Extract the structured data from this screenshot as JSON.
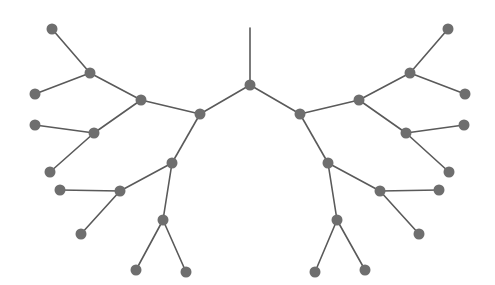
{
  "diagram": {
    "type": "binary-tree",
    "colors": {
      "edge": "#5a5a5a",
      "node": "#6e6e6e",
      "background": "#ffffff"
    },
    "node_radius": 5.5,
    "stem": {
      "x1": 250,
      "y1": 28,
      "x2": 250,
      "y2": 85
    },
    "nodes": [
      {
        "id": "root",
        "x": 250,
        "y": 85
      },
      {
        "id": "L1",
        "x": 200,
        "y": 114
      },
      {
        "id": "L2a",
        "x": 141,
        "y": 100
      },
      {
        "id": "L3a",
        "x": 90,
        "y": 73
      },
      {
        "id": "L4a1",
        "x": 52,
        "y": 29
      },
      {
        "id": "L4a2",
        "x": 35,
        "y": 94
      },
      {
        "id": "L3b",
        "x": 94,
        "y": 133
      },
      {
        "id": "L4b1",
        "x": 35,
        "y": 125
      },
      {
        "id": "L4b2",
        "x": 50,
        "y": 172
      },
      {
        "id": "L2b",
        "x": 172,
        "y": 163
      },
      {
        "id": "L3c",
        "x": 120,
        "y": 191
      },
      {
        "id": "L4c1",
        "x": 60,
        "y": 190
      },
      {
        "id": "L4c2",
        "x": 81,
        "y": 234
      },
      {
        "id": "L3d",
        "x": 163,
        "y": 220
      },
      {
        "id": "L4d1",
        "x": 136,
        "y": 270
      },
      {
        "id": "L4d2",
        "x": 186,
        "y": 272
      },
      {
        "id": "R1",
        "x": 300,
        "y": 114
      },
      {
        "id": "R2a",
        "x": 359,
        "y": 100
      },
      {
        "id": "R3a",
        "x": 410,
        "y": 73
      },
      {
        "id": "R4a1",
        "x": 448,
        "y": 29
      },
      {
        "id": "R4a2",
        "x": 465,
        "y": 94
      },
      {
        "id": "R3b",
        "x": 406,
        "y": 133
      },
      {
        "id": "R4b1",
        "x": 464,
        "y": 125
      },
      {
        "id": "R4b2",
        "x": 449,
        "y": 172
      },
      {
        "id": "R2b",
        "x": 328,
        "y": 163
      },
      {
        "id": "R3c",
        "x": 380,
        "y": 191
      },
      {
        "id": "R4c1",
        "x": 439,
        "y": 190
      },
      {
        "id": "R4c2",
        "x": 419,
        "y": 234
      },
      {
        "id": "R3d",
        "x": 337,
        "y": 220
      },
      {
        "id": "R4d1",
        "x": 315,
        "y": 272
      },
      {
        "id": "R4d2",
        "x": 365,
        "y": 270
      }
    ],
    "edges": [
      [
        "root",
        "L1"
      ],
      [
        "root",
        "R1"
      ],
      [
        "L1",
        "L2a"
      ],
      [
        "L1",
        "L2b"
      ],
      [
        "L2a",
        "L3a"
      ],
      [
        "L2a",
        "L3b"
      ],
      [
        "L3a",
        "L4a1"
      ],
      [
        "L3a",
        "L4a2"
      ],
      [
        "L3b",
        "L4b1"
      ],
      [
        "L3b",
        "L4b2"
      ],
      [
        "L2b",
        "L3c"
      ],
      [
        "L2b",
        "L3d"
      ],
      [
        "L3c",
        "L4c1"
      ],
      [
        "L3c",
        "L4c2"
      ],
      [
        "L3d",
        "L4d1"
      ],
      [
        "L3d",
        "L4d2"
      ],
      [
        "R1",
        "R2a"
      ],
      [
        "R1",
        "R2b"
      ],
      [
        "R2a",
        "R3a"
      ],
      [
        "R2a",
        "R3b"
      ],
      [
        "R3a",
        "R4a1"
      ],
      [
        "R3a",
        "R4a2"
      ],
      [
        "R3b",
        "R4b1"
      ],
      [
        "R3b",
        "R4b2"
      ],
      [
        "R2b",
        "R3c"
      ],
      [
        "R2b",
        "R3d"
      ],
      [
        "R3c",
        "R4c1"
      ],
      [
        "R3c",
        "R4c2"
      ],
      [
        "R3d",
        "R4d1"
      ],
      [
        "R3d",
        "R4d2"
      ]
    ]
  }
}
